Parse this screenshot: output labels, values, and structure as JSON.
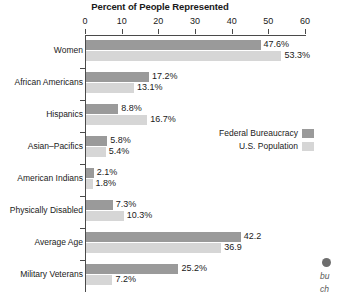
{
  "chart_data": {
    "type": "bar",
    "orientation": "horizontal",
    "title": "Percent of People Represented",
    "xlabel": "",
    "ylabel": "",
    "xlim": [
      0,
      60
    ],
    "xticks": [
      0,
      10,
      20,
      30,
      40,
      50,
      60
    ],
    "xtick_labels": [
      "0",
      "10",
      "20",
      "30",
      "40",
      "50",
      "60"
    ],
    "grid": false,
    "legend_position": "middle-right",
    "categories": [
      "Women",
      "African Americans",
      "Hispanics",
      "Asian–Pacifics",
      "American Indians",
      "Physically Disabled",
      "Average Age",
      "Military Veterans"
    ],
    "series": [
      {
        "name": "Federal Bureaucracy",
        "color": "#9a9a9a",
        "values": [
          47.6,
          17.2,
          8.8,
          5.8,
          2.1,
          7.3,
          42.2,
          25.2
        ],
        "labels": [
          "47.6%",
          "17.2%",
          "8.8%",
          "5.8%",
          "2.1%",
          "7.3%",
          "42.2",
          "25.2%"
        ]
      },
      {
        "name": "U.S. Population",
        "color": "#d6d6d6",
        "values": [
          53.3,
          13.1,
          16.7,
          5.4,
          1.8,
          10.3,
          36.9,
          7.2
        ],
        "labels": [
          "53.3%",
          "13.1%",
          "16.7%",
          "5.4%",
          "1.8%",
          "10.3%",
          "36.9",
          "7.2%"
        ]
      }
    ]
  },
  "margin_note": {
    "bullet": "bullet-marker",
    "line1": "bu",
    "line2": "ch"
  }
}
